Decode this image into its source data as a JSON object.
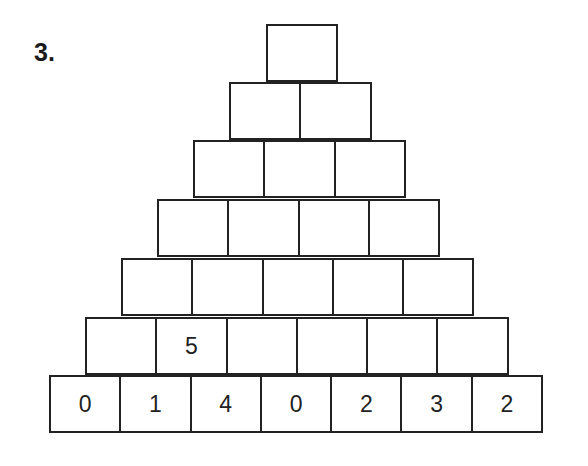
{
  "exercise": {
    "number": "3."
  },
  "pyramid": {
    "rows": [
      [
        "",
        "",
        "",
        "",
        "",
        "",
        ""
      ],
      [
        "",
        "5",
        "",
        "",
        "",
        ""
      ],
      [
        "",
        "",
        "",
        "",
        ""
      ],
      [
        "",
        "",
        "",
        ""
      ],
      [
        "",
        "",
        ""
      ],
      [
        "",
        ""
      ],
      [
        ""
      ]
    ],
    "bottom_row": [
      "0",
      "1",
      "4",
      "0",
      "2",
      "3",
      "2"
    ],
    "given_values": [
      {
        "row_from_bottom": 2,
        "position": 2,
        "value": "5"
      }
    ]
  }
}
